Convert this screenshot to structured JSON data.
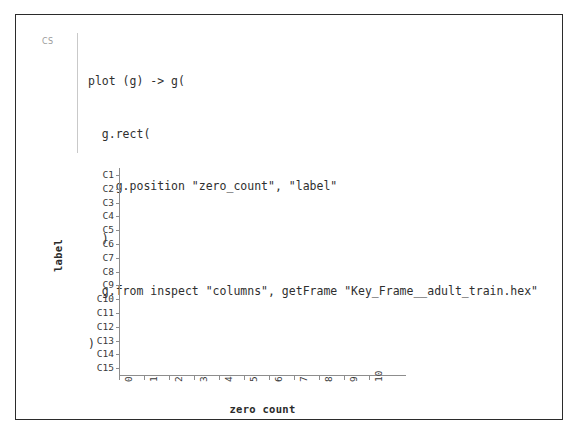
{
  "cell": {
    "gutter_label": "CS",
    "code_lines": [
      "plot (g) -> g(",
      "  g.rect(",
      "    g.position \"zero_count\", \"label\"",
      "  )",
      "  g.from inspect \"columns\", getFrame \"Key_Frame__adult_train.hex\"",
      ")"
    ]
  },
  "chart_data": {
    "type": "bar",
    "orientation": "horizontal",
    "title": "",
    "xlabel": "zero count",
    "ylabel": "label",
    "categories": [
      "C1",
      "C2",
      "C3",
      "C4",
      "C5",
      "C6",
      "C7",
      "C8",
      "C9",
      "C10",
      "C11",
      "C12",
      "C13",
      "C14",
      "C15"
    ],
    "values": [
      0,
      7.3,
      0,
      1,
      0,
      1,
      1,
      4,
      3,
      4,
      7.3,
      10.3,
      0,
      1,
      7.3
    ],
    "xticks": [
      "0",
      "1",
      "2",
      "3",
      "4",
      "5",
      "6",
      "7",
      "8",
      "9",
      "10"
    ],
    "xlim": [
      0,
      11.5
    ],
    "grid": false,
    "legend": false,
    "bar_color": "#6e6e6e",
    "axis_color": "#8d8d8d"
  }
}
